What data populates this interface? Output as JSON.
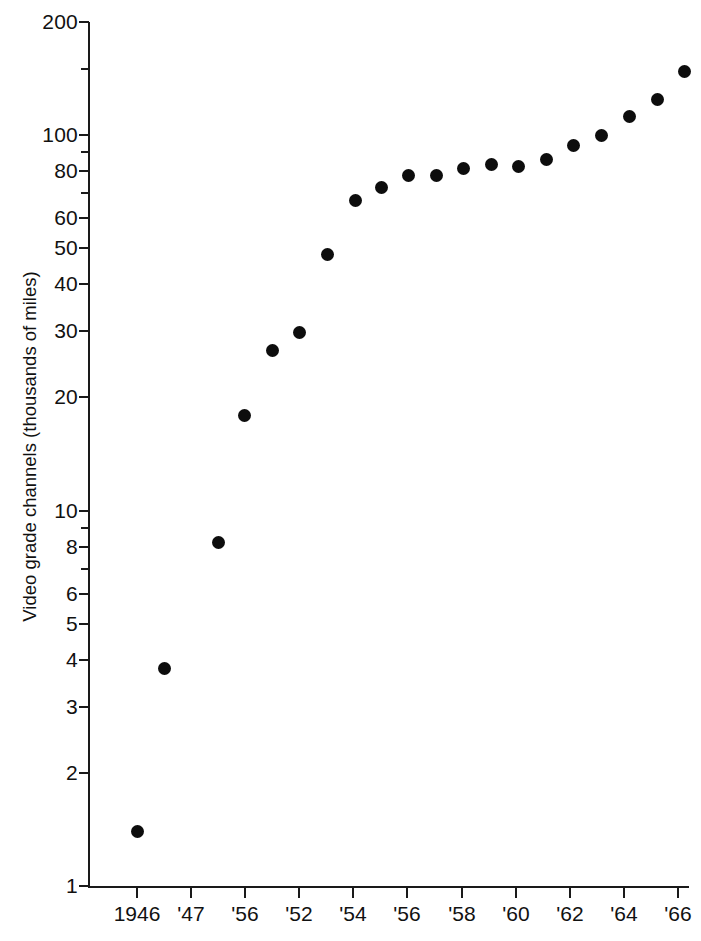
{
  "chart_data": {
    "type": "scatter",
    "title": "",
    "xlabel": "",
    "ylabel": "Video grade channels (thousands of miles)",
    "yscale": "log",
    "ylim": [
      1,
      200
    ],
    "grid": false,
    "legend": null,
    "y_ticks_major": [
      {
        "value": 200,
        "label": "200"
      },
      {
        "value": 100,
        "label": "100"
      },
      {
        "value": 80,
        "label": "80"
      },
      {
        "value": 60,
        "label": "60"
      },
      {
        "value": 50,
        "label": "50"
      },
      {
        "value": 40,
        "label": "40"
      },
      {
        "value": 30,
        "label": "30"
      },
      {
        "value": 20,
        "label": "20"
      },
      {
        "value": 10,
        "label": "10"
      },
      {
        "value": 8,
        "label": "8"
      },
      {
        "value": 6,
        "label": "6"
      },
      {
        "value": 5,
        "label": "5"
      },
      {
        "value": 4,
        "label": "4"
      },
      {
        "value": 3,
        "label": "3"
      },
      {
        "value": 2,
        "label": "2"
      },
      {
        "value": 1,
        "label": "1"
      }
    ],
    "y_ticks_minor": [
      150,
      90,
      70,
      9,
      7
    ],
    "x_tick_labels": [
      "1946",
      "'47",
      "'56",
      "'52",
      "'54",
      "'56",
      "'58",
      "'60",
      "'62",
      "'64",
      "'66"
    ],
    "x_tick_positions_px": [
      137,
      191,
      245,
      299,
      353,
      407,
      462,
      516,
      570,
      624,
      678
    ],
    "x_label_note": "axis tick labels as printed in the source scan",
    "point_color": "#0d0d0d",
    "points": [
      {
        "x_px": 137,
        "y": 1.4
      },
      {
        "x_px": 164,
        "y": 3.8
      },
      {
        "x_px": 218,
        "y": 8.2
      },
      {
        "x_px": 244,
        "y": 17.9
      },
      {
        "x_px": 272,
        "y": 26.6
      },
      {
        "x_px": 299,
        "y": 29.8
      },
      {
        "x_px": 327,
        "y": 48.0
      },
      {
        "x_px": 355,
        "y": 67.0
      },
      {
        "x_px": 381,
        "y": 72.5
      },
      {
        "x_px": 408,
        "y": 78.0
      },
      {
        "x_px": 436,
        "y": 78.0
      },
      {
        "x_px": 463,
        "y": 81.5
      },
      {
        "x_px": 491,
        "y": 83.5
      },
      {
        "x_px": 518,
        "y": 82.5
      },
      {
        "x_px": 546,
        "y": 86.0
      },
      {
        "x_px": 573,
        "y": 94.0
      },
      {
        "x_px": 601,
        "y": 100.0
      },
      {
        "x_px": 629,
        "y": 112.0
      },
      {
        "x_px": 657,
        "y": 124.0
      },
      {
        "x_px": 684,
        "y": 148.0
      }
    ]
  }
}
